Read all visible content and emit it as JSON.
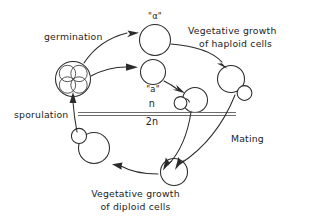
{
  "diagram": {
    "stroke_color": "#2b2b2b",
    "rule_color": "#6d6d6d",
    "background": "#ffffff",
    "labels": {
      "germination": "germination",
      "sporulation": "sporulation",
      "mating": "Mating",
      "haploid_growth_line1": "Vegetative growth",
      "haploid_growth_line2": "of haploid cells",
      "diploid_growth_line1": "Vegetative growth",
      "diploid_growth_line2": "of diploid cells",
      "ploidy_haploid": "n",
      "ploidy_diploid": "2n",
      "allele_alpha": "\"α\"",
      "allele_a": "\"a\""
    },
    "cells": [
      {
        "name": "ascus-tetrad",
        "kind": "ascus",
        "label": "ascus with four spores"
      },
      {
        "name": "haploid-cell-alpha",
        "kind": "circle",
        "label": "alpha haploid cell"
      },
      {
        "name": "haploid-cell-a",
        "kind": "circle",
        "label": "a haploid cell"
      },
      {
        "name": "budding-haploid-a",
        "kind": "budding",
        "label": "budding haploid a cell"
      },
      {
        "name": "budding-haploid-alpha",
        "kind": "budding",
        "label": "budding haploid alpha cell"
      },
      {
        "name": "diploid-zygote",
        "kind": "circle",
        "label": "diploid zygote"
      },
      {
        "name": "budding-diploid",
        "kind": "budding",
        "label": "budding diploid cell"
      }
    ],
    "arrows": [
      {
        "name": "arrow-germination-alpha",
        "from": "ascus-tetrad",
        "to": "haploid-cell-alpha"
      },
      {
        "name": "arrow-germination-a",
        "from": "ascus-tetrad",
        "to": "haploid-cell-a"
      },
      {
        "name": "arrow-a-to-budding",
        "from": "haploid-cell-a",
        "to": "budding-haploid-a"
      },
      {
        "name": "arrow-alpha-to-budding",
        "from": "haploid-cell-alpha",
        "to": "budding-haploid-alpha"
      },
      {
        "name": "arrow-mating-left",
        "from": "budding-haploid-a",
        "to": "diploid-zygote"
      },
      {
        "name": "arrow-mating-right",
        "from": "budding-haploid-alpha",
        "to": "diploid-zygote"
      },
      {
        "name": "arrow-diploid-growth",
        "from": "diploid-zygote",
        "to": "budding-diploid"
      },
      {
        "name": "arrow-sporulation",
        "from": "budding-diploid",
        "to": "ascus-tetrad"
      }
    ]
  }
}
